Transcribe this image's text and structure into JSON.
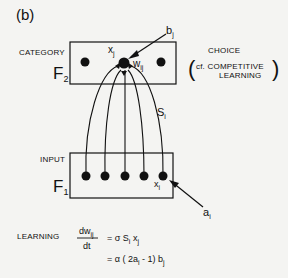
{
  "panel_label": "(b)",
  "f2": {
    "side_label": "CATEGORY",
    "layer_name": "F",
    "layer_sub": "2",
    "node_x_label": "x",
    "node_x_sub": "j",
    "weight_label": "w",
    "weight_sub": "ij",
    "b_label": "b",
    "b_sub": "j"
  },
  "choice": {
    "title": "CHOICE",
    "note_prefix": "cf.",
    "note_line1": "COMPETITIVE",
    "note_line2": "LEARNING",
    "open_paren": "(",
    "close_paren": ")"
  },
  "signal": {
    "label": "S",
    "sub": "i"
  },
  "f1": {
    "side_label": "INPUT",
    "layer_name": "F",
    "layer_sub": "1",
    "node_x_label": "x",
    "node_x_sub": "i",
    "a_label": "a",
    "a_sub": "i"
  },
  "learning": {
    "label": "LEARNING",
    "lhs_num": "dw",
    "lhs_num_sub": "ij",
    "lhs_den": "dt",
    "line1": "= σ S",
    "line1_sub1": "i",
    "line1_mid": " x",
    "line1_sub2": "j",
    "line2": "= α ( 2a",
    "line2_sub1": "i",
    "line2_mid": " - 1) b",
    "line2_sub2": "j"
  }
}
